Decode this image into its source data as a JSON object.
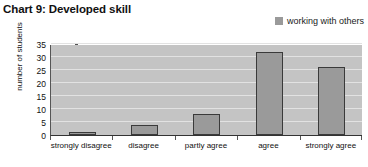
{
  "title": "Chart 9: Developed skill",
  "legend": {
    "swatch_color": "#9a9a9a",
    "items": [
      "working with others"
    ]
  },
  "axes": {
    "ylabel": "number of students",
    "yticks": [
      "0",
      "5",
      "10",
      "15",
      "20",
      "25",
      "30",
      "35"
    ],
    "xlabels": [
      "strongly disagree",
      "disagree",
      "partly agree",
      "agree",
      "strongly agree"
    ]
  },
  "colors": {
    "bar_fill": "#9a9a9a",
    "bar_border": "#3a3a3a",
    "plot_background": "#c4c4c4",
    "gridline": "#e2e2e2",
    "text": "#111111"
  },
  "chart_data": {
    "type": "bar",
    "title": "Chart 9: Developed skill",
    "xlabel": "",
    "ylabel": "number of students",
    "categories": [
      "strongly disagree",
      "disagree",
      "partly agree",
      "agree",
      "strongly agree"
    ],
    "series": [
      {
        "name": "working with others",
        "values": [
          1,
          4,
          8,
          32,
          26
        ]
      }
    ],
    "ylim": [
      0,
      35
    ],
    "ytick_step": 5,
    "grid": true,
    "legend_position": "top-right"
  }
}
